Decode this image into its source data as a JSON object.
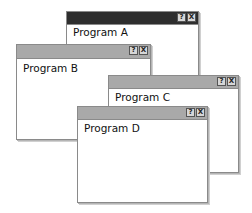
{
  "windows": [
    {
      "id": "a",
      "title": "Program A",
      "active": true,
      "help_label": "?",
      "close_label": "X"
    },
    {
      "id": "b",
      "title": "Program B",
      "active": false,
      "help_label": "?",
      "close_label": "X"
    },
    {
      "id": "c",
      "title": "Program C",
      "active": false,
      "help_label": "?",
      "close_label": "X"
    },
    {
      "id": "d",
      "title": "Program D",
      "active": false,
      "help_label": "?",
      "close_label": "X"
    }
  ],
  "colors": {
    "active_titlebar": "#2e2e2e",
    "inactive_titlebar": "#a9a9a9",
    "border": "#8a8a8a"
  }
}
